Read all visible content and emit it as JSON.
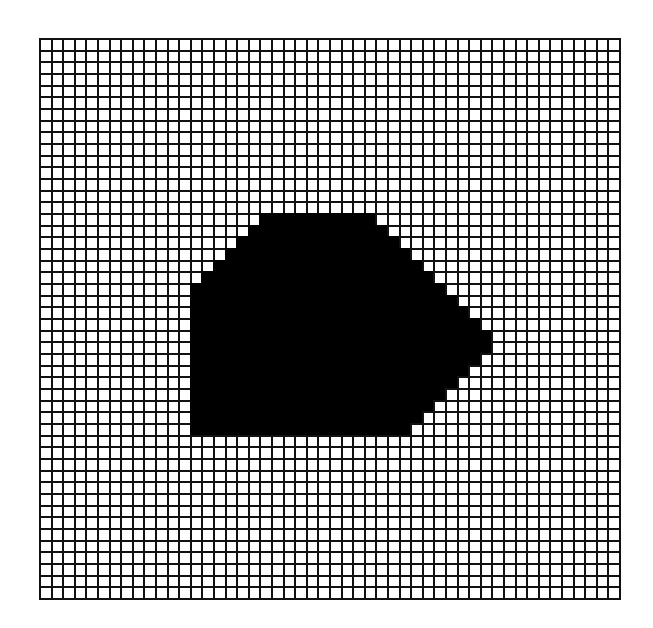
{
  "diagram": {
    "type": "pixel-grid",
    "columns": 50,
    "rows": 48,
    "colors": {
      "background": "#ffffff",
      "grid_line": "#111111",
      "fill": "#000000"
    },
    "filled_shape": {
      "description": "Filled polygon (rasterized) — per-row inclusive column spans",
      "row_spans": [
        {
          "row": 15,
          "start": 19,
          "end": 28
        },
        {
          "row": 16,
          "start": 18,
          "end": 29
        },
        {
          "row": 17,
          "start": 17,
          "end": 30
        },
        {
          "row": 18,
          "start": 16,
          "end": 31
        },
        {
          "row": 19,
          "start": 15,
          "end": 32
        },
        {
          "row": 20,
          "start": 14,
          "end": 33
        },
        {
          "row": 21,
          "start": 13,
          "end": 34
        },
        {
          "row": 22,
          "start": 13,
          "end": 35
        },
        {
          "row": 23,
          "start": 13,
          "end": 36
        },
        {
          "row": 24,
          "start": 13,
          "end": 37
        },
        {
          "row": 25,
          "start": 13,
          "end": 38
        },
        {
          "row": 26,
          "start": 13,
          "end": 38
        },
        {
          "row": 27,
          "start": 13,
          "end": 37
        },
        {
          "row": 28,
          "start": 13,
          "end": 36
        },
        {
          "row": 29,
          "start": 13,
          "end": 35
        },
        {
          "row": 30,
          "start": 13,
          "end": 34
        },
        {
          "row": 31,
          "start": 13,
          "end": 33
        },
        {
          "row": 32,
          "start": 13,
          "end": 32
        },
        {
          "row": 33,
          "start": 13,
          "end": 31
        }
      ]
    }
  }
}
